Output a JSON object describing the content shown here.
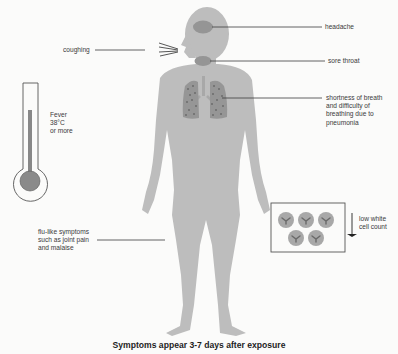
{
  "title": "Symptoms appear 3-7 days after exposure",
  "colors": {
    "body": "#bdbdbd",
    "organ": "#8f8f8f",
    "lung": "#9a9a9a",
    "lung_dots": "#555555",
    "leader_line": "#3c3c3c",
    "background": "#fbfbfa",
    "thermometer_mercury": "#888888"
  },
  "labels": {
    "headache": "headache",
    "sore_throat": "sore throat",
    "breath": "shortness of breath\nand difficulty of\nbreathing due to\npneumonia",
    "coughing": "coughing",
    "fever": "Fever\n38°C\nor more",
    "flu_like": "flu-like symptoms\nsuch as joint pain\nand malaise",
    "white_cell": "low white\ncell count"
  },
  "icons": {
    "thermometer": "thermometer-icon",
    "cough_lines": "cough-lines-icon",
    "white_cells": "white-blood-cell-icon",
    "down_arrow": "down-arrow-icon"
  },
  "white_cell_count_shown": 5
}
